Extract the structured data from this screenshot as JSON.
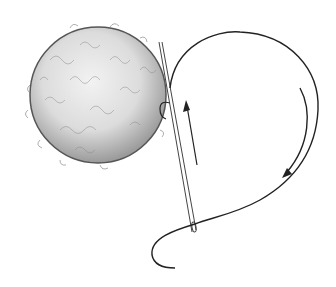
{
  "image": {
    "description": "Pencil illustration of a fluffy yarn pompom ball with a sewing needle and thread looped around it, arrows indicating stitch direction",
    "width": 336,
    "height": 287
  },
  "elements": {
    "pompom": {
      "cx": 98,
      "cy": 95,
      "r": 68,
      "fill": "#d9d9d9",
      "stroke": "#333333"
    },
    "needle": {
      "x1": 159,
      "y1": 42,
      "x2": 195,
      "y2": 232,
      "color": "#444444"
    },
    "thread_color": "#222222",
    "arrows": [
      {
        "name": "up-arrow",
        "direction": "up"
      },
      {
        "name": "curved-arrow",
        "direction": "down-clockwise"
      }
    ]
  }
}
